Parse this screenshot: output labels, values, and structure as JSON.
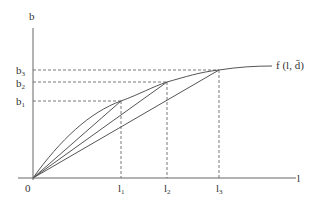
{
  "diagram": {
    "axes": {
      "y_label": "b",
      "x_label": "l",
      "origin_label": "0"
    },
    "y_ticks": [
      {
        "base": "b",
        "sub": "3"
      },
      {
        "base": "b",
        "sub": "2"
      },
      {
        "base": "b",
        "sub": "1"
      }
    ],
    "x_ticks": [
      {
        "base": "l",
        "sub": "1"
      },
      {
        "base": "l",
        "sub": "2"
      },
      {
        "base": "l",
        "sub": "3"
      }
    ],
    "curve_label": "f (l, d̄)",
    "colors": {
      "line": "#555555",
      "dashed": "#555555",
      "text": "#333333",
      "background": "#ffffff"
    }
  }
}
